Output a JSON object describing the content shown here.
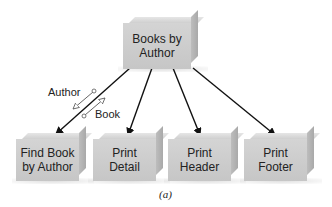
{
  "diagram": {
    "root": {
      "label_line1": "Books by",
      "label_line2": "Author"
    },
    "children": [
      {
        "label_line1": "Find Book",
        "label_line2": "by Author"
      },
      {
        "label_line1": "Print",
        "label_line2": "Detail"
      },
      {
        "label_line1": "Print",
        "label_line2": "Header"
      },
      {
        "label_line1": "Print",
        "label_line2": "Footer"
      }
    ],
    "couples": [
      {
        "label": "Author",
        "direction": "up",
        "type": "data"
      },
      {
        "label": "Book",
        "direction": "down",
        "type": "data"
      }
    ],
    "caption": "(a)"
  }
}
